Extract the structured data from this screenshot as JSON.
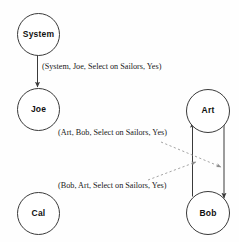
{
  "diagram": {
    "background_color": "#fefefe",
    "stroke_color": "#3a3a3a",
    "text_color": "#1a1a1a",
    "nodes": [
      {
        "id": "system",
        "label": "System",
        "cx": 37.5,
        "cy": 33.5,
        "r": 20.5
      },
      {
        "id": "joe",
        "label": "Joe",
        "cx": 37.5,
        "cy": 108.0,
        "r": 20.5
      },
      {
        "id": "cal",
        "label": "Cal",
        "cx": 37.5,
        "cy": 212.0,
        "r": 20.5
      },
      {
        "id": "art",
        "label": "Art",
        "cx": 207.0,
        "cy": 109.5,
        "r": 21.0
      },
      {
        "id": "bob",
        "label": "Bob",
        "cx": 207.0,
        "cy": 212.0,
        "r": 21.0
      }
    ],
    "edges": [
      {
        "id": "system-joe",
        "from": "system",
        "to": "joe",
        "style": "solid",
        "direction": "down"
      },
      {
        "id": "bob-art",
        "from": "bob",
        "to": "art",
        "style": "solid",
        "direction": "up"
      },
      {
        "id": "art-bob",
        "from": "art",
        "to": "bob",
        "style": "solid",
        "direction": "down"
      }
    ],
    "edge_labels": [
      {
        "id": "label-system-joe",
        "text": "(System, Joe, Select on Sailors, Yes)",
        "x": 42,
        "y": 63
      },
      {
        "id": "label-art-bob",
        "text": "(Art, Bob, Select on Sailors, Yes)",
        "x": 58,
        "y": 129
      },
      {
        "id": "label-bob-art",
        "text": "(Bob, Art, Select on Sailors, Yes)",
        "x": 58,
        "y": 182
      }
    ],
    "leader_lines": [
      {
        "id": "leader-art-bob",
        "style": "dashed",
        "x1": 161,
        "y1": 142,
        "x2": 221,
        "y2": 167
      },
      {
        "id": "leader-bob-art",
        "style": "dashed",
        "x1": 148,
        "y1": 180,
        "x2": 196,
        "y2": 162
      }
    ]
  }
}
